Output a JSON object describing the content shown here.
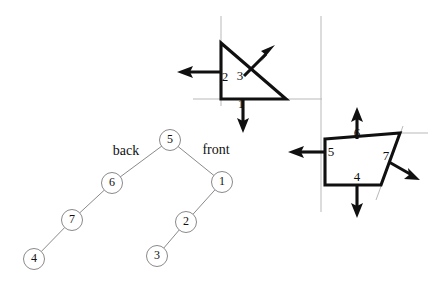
{
  "figure": {
    "colors": {
      "ink": "#101010",
      "guide": "#b9b9b9",
      "tree_stroke": "#8a8a8a",
      "background": "#ffffff"
    }
  },
  "shapes": {
    "triangle": {
      "name": "triangle-region",
      "vertices": [
        [
          221,
          43
        ],
        [
          221,
          99
        ],
        [
          286,
          99
        ]
      ],
      "edges": [
        {
          "id": "1",
          "label": "1",
          "label_pos": [
            241,
            104
          ],
          "normal_dir": "down"
        },
        {
          "id": "2",
          "label": "2",
          "label_pos": [
            225,
            78
          ],
          "normal_dir": "left"
        },
        {
          "id": "3",
          "label": "3",
          "label_pos": [
            240,
            77
          ],
          "normal_dir": "up-right"
        }
      ]
    },
    "quad": {
      "name": "quadrilateral-region",
      "vertices": [
        [
          325,
          139
        ],
        [
          400,
          133
        ],
        [
          381,
          185
        ],
        [
          325,
          185
        ]
      ],
      "edges": [
        {
          "id": "4",
          "label": "4",
          "label_pos": [
            357,
            178
          ],
          "normal_dir": "down"
        },
        {
          "id": "5",
          "label": "5",
          "label_pos": [
            331,
            153
          ],
          "normal_dir": "left"
        },
        {
          "id": "6",
          "label": "6",
          "label_pos": [
            357,
            134
          ],
          "normal_dir": "up"
        },
        {
          "id": "7",
          "label": "7",
          "label_pos": [
            386,
            157
          ],
          "normal_dir": "down-right"
        }
      ]
    }
  },
  "arrows": {
    "arrow_1": {
      "label": "1",
      "from": [
        243,
        99
      ],
      "to": [
        243,
        131
      ]
    },
    "arrow_2": {
      "label": "2",
      "from": [
        221,
        72
      ],
      "to": [
        178,
        72
      ]
    },
    "arrow_3": {
      "label": "3",
      "from": [
        244,
        76
      ],
      "to": [
        274,
        46
      ]
    },
    "arrow_4": {
      "label": "4",
      "from": [
        357,
        185
      ],
      "to": [
        357,
        216
      ]
    },
    "arrow_5": {
      "label": "5",
      "from": [
        325,
        152
      ],
      "to": [
        289,
        152
      ]
    },
    "arrow_6": {
      "label": "6",
      "from": [
        357,
        139
      ],
      "to": [
        357,
        108
      ]
    },
    "arrow_7": {
      "label": "7",
      "from": [
        389,
        162
      ],
      "to": [
        419,
        179
      ]
    }
  },
  "guides": {
    "vertical_left": {
      "x": 221,
      "y1": 16,
      "y2": 106
    },
    "horizontal_mid": {
      "y": 99,
      "x1": 193,
      "x2": 322
    },
    "vertical_right": {
      "x": 321,
      "y1": 16,
      "y2": 212
    },
    "horizontal_quad_top": {
      "y": 133,
      "x1": 400,
      "x2": 428
    },
    "diagonal_quad_right": {
      "x1": 403,
      "y1": 126,
      "x2": 376,
      "y2": 200
    }
  },
  "tree": {
    "name": "bsp-tree",
    "root": "5",
    "nodes": [
      {
        "id": "5",
        "label": "5",
        "x": 170,
        "y": 140,
        "r": 10
      },
      {
        "id": "6",
        "label": "6",
        "x": 112,
        "y": 183,
        "r": 10
      },
      {
        "id": "7",
        "label": "7",
        "x": 72,
        "y": 220,
        "r": 10
      },
      {
        "id": "4",
        "label": "4",
        "x": 34,
        "y": 259,
        "r": 10
      },
      {
        "id": "1",
        "label": "1",
        "x": 222,
        "y": 182,
        "r": 10
      },
      {
        "id": "2",
        "label": "2",
        "x": 186,
        "y": 222,
        "r": 10
      },
      {
        "id": "3",
        "label": "3",
        "x": 157,
        "y": 256,
        "r": 10
      }
    ],
    "edges": [
      {
        "from": "5",
        "to": "6"
      },
      {
        "from": "6",
        "to": "7"
      },
      {
        "from": "7",
        "to": "4"
      },
      {
        "from": "5",
        "to": "1"
      },
      {
        "from": "1",
        "to": "2"
      },
      {
        "from": "2",
        "to": "3"
      }
    ],
    "branch_labels": [
      {
        "id": "back",
        "text": "back",
        "x": 126,
        "y": 152
      },
      {
        "id": "front",
        "text": "front",
        "x": 216,
        "y": 151
      }
    ]
  }
}
